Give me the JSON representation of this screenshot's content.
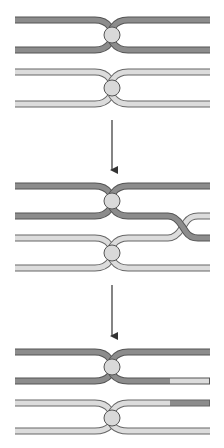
{
  "diagram": {
    "title": "",
    "colors": {
      "dark_chromatid": "#8c8c8c",
      "light_chromatid": "#dcdcdc",
      "outline": "#555555",
      "centromere": "#d9d9d9",
      "arrow": "#333333",
      "background": "#ffffff"
    },
    "stages": [
      {
        "label": "homologous pair before crossover"
      },
      {
        "label": "crossing over between non-sister chromatids"
      },
      {
        "label": "recombinant chromatids after exchange"
      }
    ],
    "arrows": [
      {
        "from_stage": 1,
        "to_stage": 2
      },
      {
        "from_stage": 2,
        "to_stage": 3
      }
    ]
  }
}
